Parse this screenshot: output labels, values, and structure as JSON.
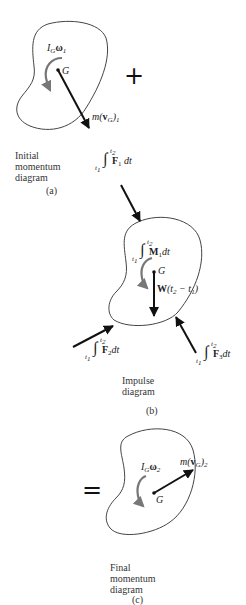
{
  "figure": {
    "panels": [
      {
        "id": "a",
        "caption_lines": [
          "Initial",
          "momentum",
          "diagram"
        ],
        "label": "(a)",
        "angular_momentum": {
          "sym": "I",
          "sub": "G",
          "omega": "ω",
          "omega_sub": "1"
        },
        "center_label": "G",
        "linear_momentum": {
          "pre": "m(",
          "v": "v",
          "vsub": "G",
          "post": ")",
          "sub": "1"
        }
      },
      {
        "id": "b",
        "caption_lines": [
          "Impulse",
          "diagram"
        ],
        "label": "(b)",
        "center_label": "G",
        "moment_impulse": {
          "upper": "t",
          "upper_sub": "2",
          "lower": "t",
          "lower_sub": "1",
          "vec": "M",
          "vec_sub": "1",
          "dt": "dt"
        },
        "weight_impulse": {
          "w": "W",
          "text": "(t",
          "s2": "2",
          "mid": " − t",
          "s1": "1",
          "close": ")"
        },
        "force_impulses": [
          {
            "upper": "t",
            "upper_sub": "2",
            "lower": "t",
            "lower_sub": "1",
            "vec": "F",
            "vec_sub": "1",
            "dt": "dt"
          },
          {
            "upper": "t",
            "upper_sub": "2",
            "lower": "t",
            "lower_sub": "1",
            "vec": "F",
            "vec_sub": "2",
            "dt": "dt"
          },
          {
            "upper": "t",
            "upper_sub": "2",
            "lower": "t",
            "lower_sub": "1",
            "vec": "F",
            "vec_sub": "3",
            "dt": "dt"
          }
        ]
      },
      {
        "id": "c",
        "caption_lines": [
          "Final",
          "momentum",
          "diagram"
        ],
        "label": "(c)",
        "angular_momentum": {
          "sym": "I",
          "sub": "G",
          "omega": "ω",
          "omega_sub": "2"
        },
        "center_label": "G",
        "linear_momentum": {
          "pre": "m(",
          "v": "v",
          "vsub": "G",
          "post": ")",
          "sub": "2"
        }
      }
    ],
    "operators": {
      "plus": "+",
      "equals": "="
    },
    "integral_sign": "∫",
    "colors": {
      "line": "#222222",
      "curl_arrow": "#777777",
      "background": "#ffffff"
    }
  }
}
